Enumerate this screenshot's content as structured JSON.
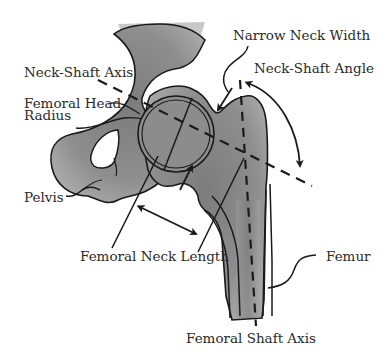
{
  "diagram": {
    "labels": {
      "narrow_neck_width": "Narrow Neck Width",
      "neck_shaft_axis": "Neck-Shaft Axis",
      "neck_shaft_angle": "Neck-Shaft Angle",
      "femoral_head_radius_line1": "Femoral Head",
      "femoral_head_radius_line2": "Radius",
      "pelvis": "Pelvis",
      "femoral_neck_length": "Femoral Neck Length",
      "femur": "Femur",
      "femoral_shaft_axis": "Femoral Shaft Axis"
    },
    "colors": {
      "bone_fill": "#8a8a8a",
      "bone_shadow": "#6e6e6e",
      "outline": "#1a1a1a",
      "text": "#2a2a2a",
      "background": "#ffffff"
    }
  }
}
